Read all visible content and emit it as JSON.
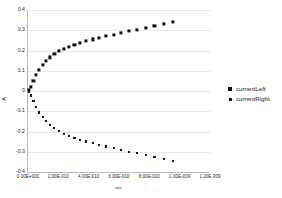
{
  "chart_data": {
    "type": "scatter",
    "title": "",
    "xlabel": "sec",
    "ylabel": "A",
    "xlim": [
      0,
      1.2e-09
    ],
    "ylim": [
      -0.4,
      0.4
    ],
    "grid": true,
    "legend_position": "right",
    "xticks": [
      "0.00E+000",
      "2.00E-010",
      "4.00E-010",
      "6.00E-010",
      "8.00E-010",
      "1.00E-009",
      "1.20E-009"
    ],
    "xtick_values": [
      0,
      2e-10,
      4e-10,
      6e-10,
      8e-10,
      1e-09,
      1.2e-09
    ],
    "yticks": [
      "0.4",
      "0.3",
      "0.2",
      "0.1",
      "0",
      "-0.1",
      "-0.2",
      "-0.3",
      "-0.4"
    ],
    "ytick_values": [
      0.4,
      0.3,
      0.2,
      0.1,
      0,
      -0.1,
      -0.2,
      -0.3,
      -0.4
    ],
    "series": [
      {
        "name": "currentLeft",
        "marker": "square",
        "color": "#111111",
        "x": [
          5e-12,
          2e-11,
          3.6e-11,
          5.4e-11,
          7.4e-11,
          9.6e-11,
          1.2e-10,
          1.46e-10,
          1.74e-10,
          2.04e-10,
          2.36e-10,
          2.7e-10,
          3.06e-10,
          3.44e-10,
          3.84e-10,
          4.26e-10,
          4.7e-10,
          5.16e-10,
          5.64e-10,
          6.14e-10,
          6.66e-10,
          7.2e-10,
          7.76e-10,
          8.34e-10,
          8.94e-10,
          9.56e-10
        ],
        "y": [
          0.005,
          0.02,
          0.048,
          0.078,
          0.104,
          0.128,
          0.148,
          0.166,
          0.182,
          0.196,
          0.208,
          0.219,
          0.229,
          0.238,
          0.247,
          0.255,
          0.263,
          0.271,
          0.279,
          0.287,
          0.295,
          0.303,
          0.311,
          0.32,
          0.33,
          0.34
        ]
      },
      {
        "name": "currentRight",
        "marker": "square-small",
        "color": "#111111",
        "x": [
          5e-12,
          2e-11,
          3.6e-11,
          5.4e-11,
          7.4e-11,
          9.6e-11,
          1.2e-10,
          1.46e-10,
          1.74e-10,
          2.04e-10,
          2.36e-10,
          2.7e-10,
          3.06e-10,
          3.44e-10,
          3.84e-10,
          4.26e-10,
          4.7e-10,
          5.16e-10,
          5.64e-10,
          6.14e-10,
          6.66e-10,
          7.2e-10,
          7.76e-10,
          8.34e-10,
          8.94e-10,
          9.56e-10
        ],
        "y": [
          -0.006,
          -0.022,
          -0.05,
          -0.08,
          -0.106,
          -0.13,
          -0.15,
          -0.168,
          -0.184,
          -0.198,
          -0.21,
          -0.221,
          -0.231,
          -0.24,
          -0.249,
          -0.257,
          -0.266,
          -0.274,
          -0.282,
          -0.291,
          -0.299,
          -0.308,
          -0.317,
          -0.326,
          -0.336,
          -0.345
        ]
      }
    ]
  },
  "legend": {
    "items": [
      {
        "label": "currentLeft"
      },
      {
        "label": "currentRight"
      }
    ]
  }
}
